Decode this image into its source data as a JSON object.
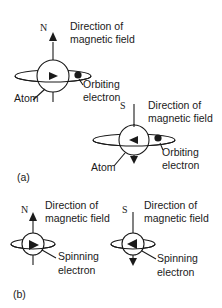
{
  "figure": {
    "part_a": {
      "label": "(a)",
      "atom_north": {
        "pole": "N",
        "field_label_line1": "Direction of",
        "field_label_line2": "magnetic field",
        "electron_label_line1": "Orbiting",
        "electron_label_line2": "electron",
        "atom_label": "Atom"
      },
      "atom_south": {
        "pole": "S",
        "field_label_line1": "Direction of",
        "field_label_line2": "magnetic field",
        "electron_label_line1": "Orbiting",
        "electron_label_line2": "electron",
        "atom_label": "Atom"
      }
    },
    "part_b": {
      "label": "(b)",
      "spin_north": {
        "pole": "N",
        "field_label_line1": "Direction of",
        "field_label_line2": "magnetic field",
        "electron_label_line1": "Spinning",
        "electron_label_line2": "electron"
      },
      "spin_south": {
        "pole": "S",
        "field_label_line1": "Direction of",
        "field_label_line2": "magnetic field",
        "electron_label_line1": "Spinning",
        "electron_label_line2": "electron"
      }
    },
    "colors": {
      "ink": "#1a1a1a",
      "background": "#ffffff"
    }
  }
}
